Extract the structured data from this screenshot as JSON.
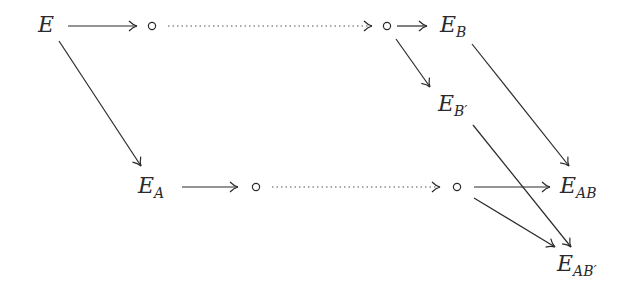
{
  "diagram": {
    "type": "commutative-diagram",
    "nodes": [
      {
        "id": "E",
        "label": "E",
        "sub": ""
      },
      {
        "id": "c1",
        "label": "∘"
      },
      {
        "id": "c2",
        "label": "∘"
      },
      {
        "id": "EB",
        "label": "E",
        "sub": "B"
      },
      {
        "id": "EBp",
        "label": "E",
        "sub": "B′"
      },
      {
        "id": "EA",
        "label": "E",
        "sub": "A"
      },
      {
        "id": "c3",
        "label": "∘"
      },
      {
        "id": "c4",
        "label": "∘"
      },
      {
        "id": "EAB",
        "label": "E",
        "sub": "AB"
      },
      {
        "id": "EABp",
        "label": "E",
        "sub": "AB′"
      }
    ],
    "edges": [
      {
        "from": "E",
        "to": "c1",
        "style": "solid-arrow"
      },
      {
        "from": "c1",
        "to": "c2",
        "style": "dotted-arrow"
      },
      {
        "from": "c2",
        "to": "EB",
        "style": "solid-arrow"
      },
      {
        "from": "c2",
        "to": "EBp",
        "style": "solid-arrow"
      },
      {
        "from": "E",
        "to": "EA",
        "style": "solid-arrow"
      },
      {
        "from": "EA",
        "to": "c3",
        "style": "solid-arrow"
      },
      {
        "from": "c3",
        "to": "c4",
        "style": "dotted-arrow"
      },
      {
        "from": "c4",
        "to": "EAB",
        "style": "solid-arrow"
      },
      {
        "from": "c4",
        "to": "EABp",
        "style": "solid-arrow"
      },
      {
        "from": "EB",
        "to": "EAB",
        "style": "solid-arrow"
      },
      {
        "from": "EBp",
        "to": "EABp",
        "style": "solid-arrow"
      }
    ],
    "labels": {
      "E": {
        "main": "E",
        "sub": ""
      },
      "EB": {
        "main": "E",
        "sub": "B"
      },
      "EBp": {
        "main": "E",
        "sub": "B′"
      },
      "EA": {
        "main": "E",
        "sub": "A"
      },
      "EAB": {
        "main": "E",
        "sub": "AB"
      },
      "EABp": {
        "main": "E",
        "sub": "AB′"
      }
    },
    "colors": {
      "ink": "#2a2a2a",
      "background": "#ffffff"
    }
  }
}
